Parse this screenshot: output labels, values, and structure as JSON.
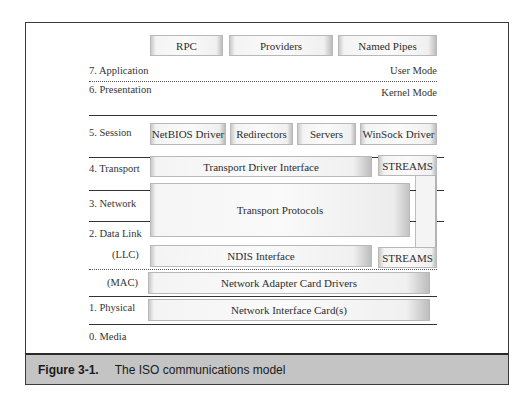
{
  "figure": {
    "number": "Figure 3-1.",
    "title": "The ISO communications model"
  },
  "layers": {
    "application": "7. Application",
    "presentation": "6. Presentation",
    "session": "5. Session",
    "transport": "4. Transport",
    "network": "3. Network",
    "data_link": "2. Data Link",
    "llc": "(LLC)",
    "mac": "(MAC)",
    "physical": "1. Physical",
    "media": "0. Media"
  },
  "modes": {
    "user": "User Mode",
    "kernel": "Kernel Mode"
  },
  "components": {
    "application_row": [
      "RPC",
      "Providers",
      "Named Pipes"
    ],
    "session_row": [
      "NetBIOS Driver",
      "Redirectors",
      "Servers",
      "WinSock Driver"
    ],
    "tdi": "Transport Driver Interface",
    "streams_top": "STREAMS",
    "transport_protocols": "Transport Protocols",
    "ndis": "NDIS Interface",
    "streams_bottom": "STREAMS",
    "adapter_drivers": "Network Adapter Card Drivers",
    "nic": "Network Interface Card(s)"
  }
}
